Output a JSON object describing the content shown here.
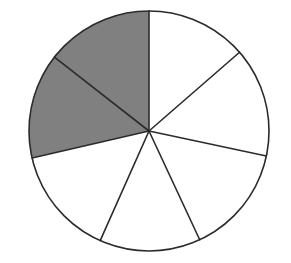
{
  "figure": {
    "background_color": "#ffffff",
    "canvas": {
      "width": 291,
      "height": 263
    }
  },
  "chart_data": {
    "type": "pie",
    "title": "",
    "subtitle": "",
    "xlabel": "",
    "ylabel": "",
    "legend_position": "none",
    "grid": false,
    "center": {
      "x": 149,
      "y": 131
    },
    "radius": 120,
    "outline_color": "#2b2b2b",
    "outline_width": 1.6,
    "spoke_color": "#2b2b2b",
    "spoke_width": 1.6,
    "shaded_color": "#808080",
    "unshaded_color": "#ffffff",
    "total_sectors": 7,
    "shaded_sectors": 2,
    "shaded_fraction": "2/7",
    "angle_units": "degrees clockwise from 12 o'clock",
    "boundary_angles": [
      0,
      49,
      102,
      155,
      204,
      257,
      308
    ],
    "categories": [
      "sector-1",
      "sector-2",
      "sector-3",
      "sector-4",
      "sector-5",
      "sector-6",
      "sector-7"
    ],
    "values": [
      49,
      53,
      53,
      49,
      53,
      51,
      52
    ],
    "series": [
      {
        "name": "sector angles",
        "values": [
          49,
          53,
          53,
          49,
          53,
          51,
          52
        ]
      }
    ],
    "sectors": [
      {
        "id": "sector-1",
        "start_angle": 0,
        "end_angle": 49,
        "sweep": 49,
        "shaded": false,
        "fill": "#ffffff"
      },
      {
        "id": "sector-2",
        "start_angle": 49,
        "end_angle": 102,
        "sweep": 53,
        "shaded": false,
        "fill": "#ffffff"
      },
      {
        "id": "sector-3",
        "start_angle": 102,
        "end_angle": 155,
        "sweep": 53,
        "shaded": false,
        "fill": "#ffffff"
      },
      {
        "id": "sector-4",
        "start_angle": 155,
        "end_angle": 204,
        "sweep": 49,
        "shaded": false,
        "fill": "#ffffff"
      },
      {
        "id": "sector-5",
        "start_angle": 204,
        "end_angle": 257,
        "sweep": 53,
        "shaded": false,
        "fill": "#ffffff"
      },
      {
        "id": "sector-6",
        "start_angle": 257,
        "end_angle": 308,
        "sweep": 51,
        "shaded": true,
        "fill": "#808080"
      },
      {
        "id": "sector-7",
        "start_angle": 308,
        "end_angle": 360,
        "sweep": 52,
        "shaded": true,
        "fill": "#808080"
      }
    ]
  }
}
